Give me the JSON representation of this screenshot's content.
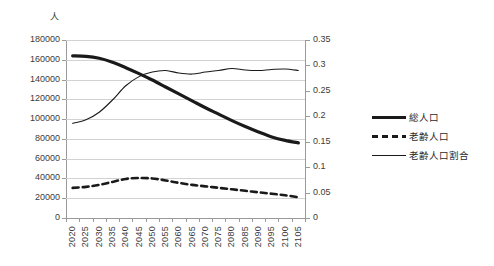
{
  "chart_data": {
    "type": "line",
    "title": "",
    "subtitle": "",
    "xlabel": "",
    "ylabel": "人",
    "y2label": "",
    "unit_left": "人",
    "grid": true,
    "legend_position": "right",
    "x": [
      "2020",
      "2025",
      "2030",
      "2035",
      "2040",
      "2045",
      "2050",
      "2055",
      "2060",
      "2065",
      "2070",
      "2075",
      "2080",
      "2085",
      "2090",
      "2095",
      "2100",
      "2105"
    ],
    "ylim": [
      0,
      180000
    ],
    "yticks": [
      "0",
      "20000",
      "40000",
      "60000",
      "80000",
      "100000",
      "120000",
      "140000",
      "160000",
      "180000"
    ],
    "y2lim": [
      0,
      0.35
    ],
    "y2ticks": [
      "0",
      "0.05",
      "0.1",
      "0.15",
      "0.2",
      "0.25",
      "0.3",
      "0.35"
    ],
    "series": [
      {
        "name": "総人口",
        "axis": "left",
        "style": "thick-solid",
        "color": "#1a1a1a",
        "values": [
          164000,
          163500,
          161500,
          157500,
          152000,
          146000,
          139500,
          132500,
          125500,
          118500,
          111500,
          105000,
          98500,
          92500,
          87000,
          82000,
          78500,
          76000
        ]
      },
      {
        "name": "老齢人口",
        "axis": "left",
        "style": "dashed",
        "color": "#1a1a1a",
        "values": [
          30500,
          31500,
          33500,
          36500,
          39500,
          40500,
          40000,
          38000,
          35500,
          33500,
          32000,
          30500,
          29000,
          27500,
          26000,
          24500,
          23000,
          21000
        ]
      },
      {
        "name": "老齢人口割合",
        "axis": "right",
        "style": "thin-solid",
        "color": "#1a1a1a",
        "values": [
          0.186,
          0.193,
          0.208,
          0.232,
          0.26,
          0.278,
          0.287,
          0.29,
          0.285,
          0.283,
          0.287,
          0.29,
          0.294,
          0.291,
          0.29,
          0.292,
          0.293,
          0.29
        ]
      }
    ],
    "legend": [
      {
        "label": "総人口",
        "style": "thick-solid"
      },
      {
        "label": "老齢人口",
        "style": "dashed"
      },
      {
        "label": "老齢人口割合",
        "style": "thin-solid"
      }
    ]
  }
}
